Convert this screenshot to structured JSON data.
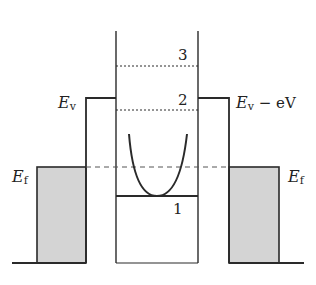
{
  "diagram": {
    "type": "energy-band-diagram",
    "labels": {
      "left_barrier": {
        "main": "E",
        "sub": "v"
      },
      "right_barrier": {
        "main": "E",
        "sub": "v",
        "suffix": " − eV"
      },
      "left_fermi": {
        "main": "E",
        "sub": "f"
      },
      "right_fermi": {
        "main": "E",
        "sub": "f"
      },
      "level_1": "1",
      "level_2": "2",
      "level_3": "3"
    },
    "colors": {
      "line": "#2a2a2a",
      "fill": "#d4d4d4",
      "background": "#ffffff"
    }
  }
}
